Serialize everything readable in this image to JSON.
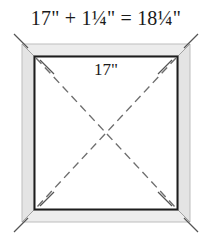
{
  "figure": {
    "kind": "picture-frame-dimension-diagram",
    "outer_dimension_label": "17\" + 1¼\" = 18¼\"",
    "inner_dimension_label": "17\"",
    "parts": {
      "outer_equation_terms": {
        "opening_size": "17\"",
        "operator_plus": "+",
        "frame_overlap": "1¼\"",
        "operator_equals": "=",
        "outside_size": "18¼\""
      }
    },
    "colors": {
      "background": "#ffffff",
      "frame_fill": "#e9e9e9",
      "frame_fill_light": "#f3f3f3",
      "frame_outline": "#b8b8b8",
      "inner_square_stroke": "#1a1a1a",
      "inner_square_fill": "#ffffff",
      "diagonal_dash": "#6e6e6e",
      "miter_line": "#9a9a9a",
      "extension_tick": "#5a5a5a",
      "text": "#1a1a1a"
    },
    "geometry": {
      "frame_outer": {
        "x": 22,
        "y": 44,
        "width": 168,
        "height": 178
      },
      "frame_inner": {
        "x": 34,
        "y": 56,
        "width": 144,
        "height": 154
      },
      "center": {
        "x": 106,
        "y": 133
      }
    },
    "annotations": {
      "dash_pattern": "8 5",
      "diagonal_count": 2,
      "miter_corner_count": 4,
      "extension_tick_count": 4
    }
  }
}
